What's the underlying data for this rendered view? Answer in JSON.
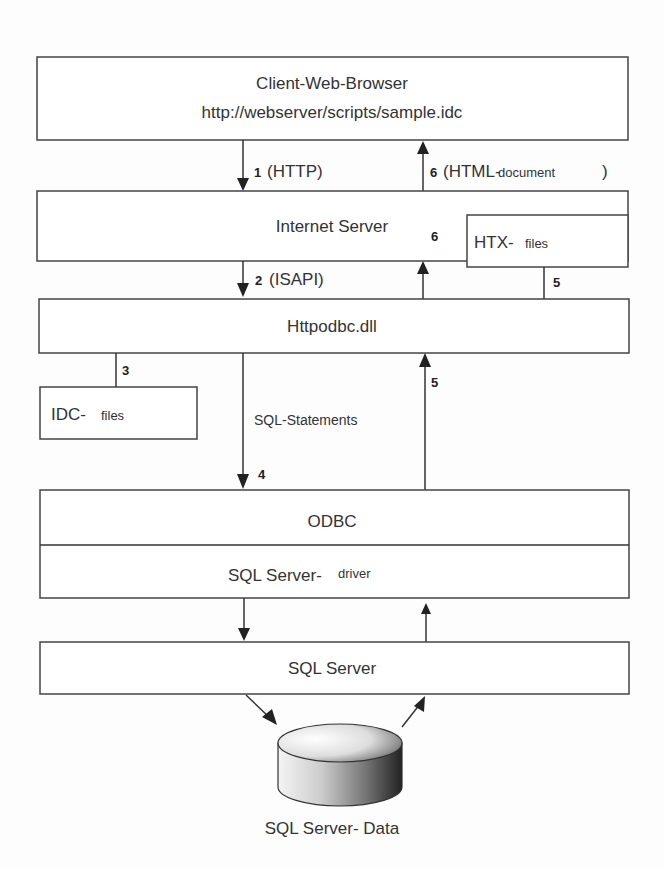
{
  "boxes": {
    "client": {
      "line1": "Client-Web-Browser",
      "line2": "http://webserver/scripts/sample.idc"
    },
    "internet_server": {
      "label": "Internet Server"
    },
    "htx": {
      "label_main": "HTX-",
      "label_sub": "files"
    },
    "httpodbc": {
      "label": "Httpodbc.dll"
    },
    "idc": {
      "label_main": "IDC-",
      "label_sub": "files"
    },
    "odbc": {
      "label": "ODBC"
    },
    "driver": {
      "label_main": "SQL Server-",
      "label_sub": "driver"
    },
    "sql_server": {
      "label": "SQL Server"
    }
  },
  "database": {
    "label": "SQL Server- Data"
  },
  "arrows": {
    "step1": {
      "num": "1",
      "text": "(HTTP)"
    },
    "step6_top": {
      "num": "6",
      "text_main": "(HTML-",
      "text_sub": "document",
      "close": ")"
    },
    "step2": {
      "num": "2",
      "text": "(ISAPI)"
    },
    "step6_mid": {
      "num": "6"
    },
    "step5_htx": {
      "num": "5"
    },
    "step3": {
      "num": "3"
    },
    "step4": {
      "num": "4",
      "text": "SQL-Statements"
    },
    "step5_odbc": {
      "num": "5"
    }
  },
  "colors": {
    "stroke": "#444444",
    "text": "#333333",
    "background": "#fdfdfd"
  }
}
